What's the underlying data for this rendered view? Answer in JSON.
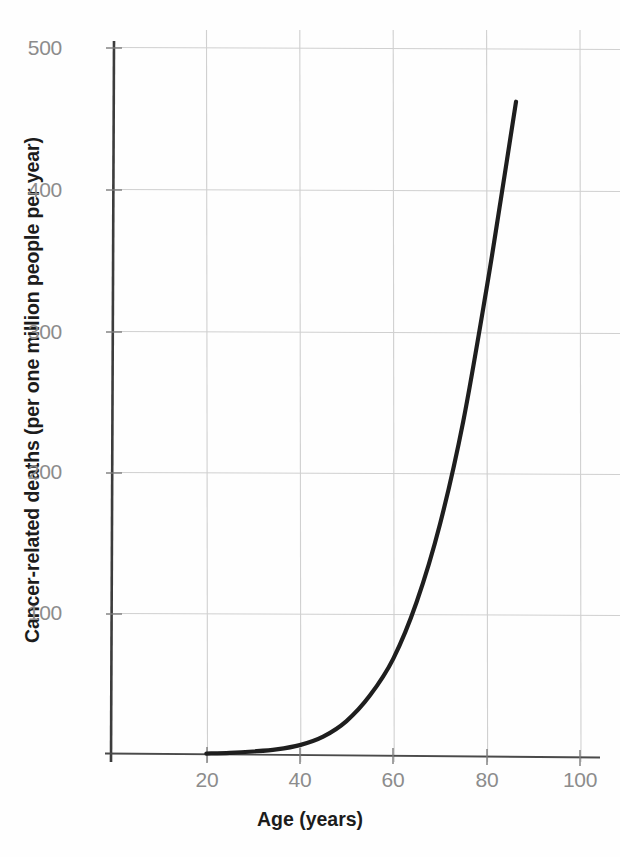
{
  "figure": {
    "background_color": "#fefefe",
    "curve_color": "#1e1e1e",
    "grid_color": "#cfcfcf",
    "axis_color": "#3a3a3a",
    "tick_label_color": "#8c8c8c",
    "title_color": "#1c1c1c"
  },
  "axes": {
    "x_title": "Age (years)",
    "y_title": "Cancer-related deaths (per one million people per year)",
    "x_ticks": [
      "20",
      "40",
      "60",
      "80",
      "100"
    ],
    "y_ticks": [
      "100",
      "200",
      "300",
      "400",
      "500"
    ]
  },
  "chart_data": {
    "type": "line",
    "title": "",
    "subtitle": "",
    "xlabel": "Age (years)",
    "ylabel": "Cancer-related deaths (per one million people per year)",
    "xlim": [
      0,
      100
    ],
    "ylim": [
      0,
      500
    ],
    "xticks": [
      20,
      40,
      60,
      80,
      100
    ],
    "yticks": [
      100,
      200,
      300,
      400,
      500
    ],
    "grid": true,
    "legend": null,
    "legend_position": "none",
    "annotations": [],
    "series": [
      {
        "name": "Cancer-related deaths",
        "color": "#1e1e1e",
        "linewidth": 4,
        "x": [
          20,
          25,
          30,
          35,
          40,
          45,
          50,
          55,
          60,
          65,
          70,
          75,
          80,
          83,
          86.3
        ],
        "y": [
          1,
          1.5,
          2.5,
          4,
          7,
          13,
          24,
          42,
          68,
          108,
          163,
          236,
          330,
          392,
          462
        ]
      }
    ]
  }
}
